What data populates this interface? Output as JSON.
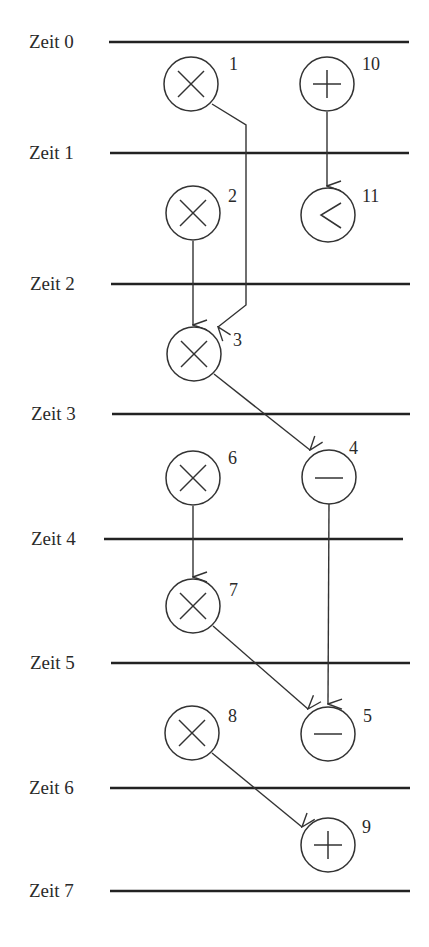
{
  "diagram": {
    "type": "scheduling-dataflow-graph",
    "time_steps": [
      {
        "label": "Zeit 0",
        "y": 42,
        "x1": 109,
        "x2": 409
      },
      {
        "label": "Zeit 1",
        "y": 153,
        "x1": 110,
        "x2": 409
      },
      {
        "label": "Zeit 2",
        "y": 284,
        "x1": 111,
        "x2": 410
      },
      {
        "label": "Zeit 3",
        "y": 414,
        "x1": 112,
        "x2": 410
      },
      {
        "label": "Zeit 4",
        "y": 539,
        "x1": 104,
        "x2": 403
      },
      {
        "label": "Zeit 5",
        "y": 663,
        "x1": 111,
        "x2": 410
      },
      {
        "label": "Zeit 6",
        "y": 788,
        "x1": 110,
        "x2": 410
      },
      {
        "label": "Zeit 7",
        "y": 891,
        "x1": 110,
        "x2": 410
      }
    ],
    "nodes": [
      {
        "id": "1",
        "op": "multiply",
        "symbol": "×",
        "cx": 191,
        "cy": 84
      },
      {
        "id": "10",
        "op": "add",
        "symbol": "+",
        "cx": 327,
        "cy": 84
      },
      {
        "id": "2",
        "op": "multiply",
        "symbol": "×",
        "cx": 193,
        "cy": 213
      },
      {
        "id": "11",
        "op": "less-than",
        "symbol": "<",
        "cx": 328,
        "cy": 215
      },
      {
        "id": "3",
        "op": "multiply",
        "symbol": "×",
        "cx": 194,
        "cy": 354
      },
      {
        "id": "4",
        "op": "subtract",
        "symbol": "−",
        "cx": 329,
        "cy": 475
      },
      {
        "id": "6",
        "op": "multiply",
        "symbol": "×",
        "cx": 193,
        "cy": 478
      },
      {
        "id": "7",
        "op": "multiply",
        "symbol": "×",
        "cx": 193,
        "cy": 606
      },
      {
        "id": "8",
        "op": "multiply",
        "symbol": "×",
        "cx": 192,
        "cy": 733
      },
      {
        "id": "5",
        "op": "subtract",
        "symbol": "−",
        "cx": 328,
        "cy": 733
      },
      {
        "id": "9",
        "op": "add",
        "symbol": "+",
        "cx": 328,
        "cy": 845
      }
    ],
    "edges": [
      {
        "from": "1",
        "to": "3"
      },
      {
        "from": "10",
        "to": "11"
      },
      {
        "from": "2",
        "to": "3"
      },
      {
        "from": "3",
        "to": "4"
      },
      {
        "from": "6",
        "to": "7"
      },
      {
        "from": "4",
        "to": "5"
      },
      {
        "from": "7",
        "to": "5"
      },
      {
        "from": "8",
        "to": "9"
      }
    ],
    "colors": {
      "line": "#222222",
      "background": "#ffffff"
    }
  }
}
